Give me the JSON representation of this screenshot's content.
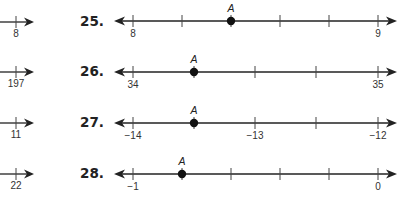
{
  "left_column": {
    "partial_lines": [
      {
        "label": "8"
      },
      {
        "label": "197"
      },
      {
        "label": "11"
      },
      {
        "label": "22"
      }
    ]
  },
  "problems": [
    {
      "number": "25.",
      "start_label": "8",
      "end_label": "9",
      "middle_label": "",
      "intervals": 5,
      "point_label": "A",
      "point_tick_index": 2,
      "point_value": "8.4"
    },
    {
      "number": "26.",
      "start_label": "34",
      "end_label": "35",
      "middle_label": "",
      "intervals": 4,
      "point_label": "A",
      "point_tick_index": 1,
      "point_value": "34.25"
    },
    {
      "number": "27.",
      "start_label": "−14",
      "end_label": "−12",
      "middle_label": "−13",
      "intervals": 4,
      "point_label": "A",
      "point_tick_index": 1,
      "point_value": "−13.5"
    },
    {
      "number": "28.",
      "start_label": "−1",
      "end_label": "0",
      "middle_label": "",
      "intervals": 5,
      "point_label": "A",
      "point_tick_index": 1,
      "point_value": "−0.8"
    }
  ]
}
